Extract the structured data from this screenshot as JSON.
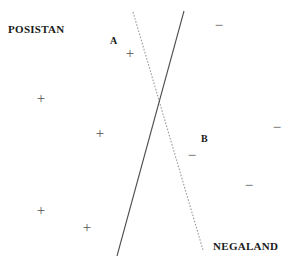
{
  "figure": {
    "width": 294,
    "height": 269,
    "background_color": "#ffffff"
  },
  "region_labels": [
    {
      "name": "positive-region-label",
      "text": "POSISTAN",
      "x": 8,
      "y": 24
    },
    {
      "name": "negative-region-label",
      "text": "NEGALAND",
      "x": 213,
      "y": 241
    }
  ],
  "boundary_labels": [
    {
      "name": "boundary-label-a",
      "text": "A",
      "x": 110,
      "y": 36
    },
    {
      "name": "boundary-label-b",
      "text": "B",
      "x": 201,
      "y": 134
    }
  ],
  "chart_data": {
    "type": "scatter",
    "xlabel": "",
    "ylabel": "",
    "xlim": [
      0,
      294
    ],
    "ylim": [
      0,
      269
    ],
    "grid": false,
    "legend": "none",
    "series": [
      {
        "name": "positive",
        "label": "POSISTAN",
        "marker": "+",
        "color": "#555555",
        "points": [
          {
            "x": 130,
            "y": 53
          },
          {
            "x": 41,
            "y": 98
          },
          {
            "x": 100,
            "y": 133
          },
          {
            "x": 41,
            "y": 210
          },
          {
            "x": 87,
            "y": 227
          }
        ]
      },
      {
        "name": "negative",
        "label": "NEGALAND",
        "marker": "−",
        "color": "#555555",
        "points": [
          {
            "x": 219,
            "y": 25
          },
          {
            "x": 277,
            "y": 127
          },
          {
            "x": 192,
            "y": 155
          },
          {
            "x": 249,
            "y": 185
          }
        ]
      }
    ],
    "annotations": [
      {
        "name": "boundary-a",
        "label": "A",
        "style": "dotted",
        "color": "#9a9a9a",
        "x1": 133,
        "y1": 12,
        "x2": 203,
        "y2": 250
      },
      {
        "name": "boundary-b",
        "label": "B",
        "style": "solid",
        "color": "#4f4f4f",
        "x1": 184,
        "y1": 11,
        "x2": 117,
        "y2": 256
      }
    ],
    "intersection": {
      "x": 158,
      "y": 100
    }
  }
}
